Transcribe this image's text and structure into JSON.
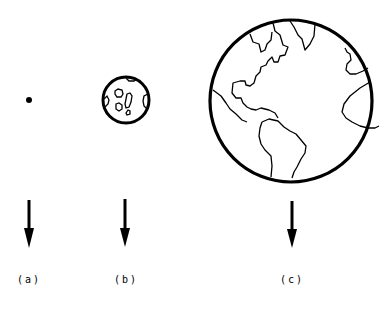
{
  "figure": {
    "panels": [
      {
        "id": "a",
        "label": "(a)",
        "object": "point mass (dot)",
        "x": 29
      },
      {
        "id": "b",
        "label": "(b)",
        "object": "moon (small cratered sphere)",
        "x": 125
      },
      {
        "id": "c",
        "label": "(c)",
        "object": "earth (large globe with continents)",
        "x": 292
      }
    ],
    "arrow_direction": "down",
    "colors": {
      "ink": "#000000",
      "background": "#ffffff"
    }
  }
}
